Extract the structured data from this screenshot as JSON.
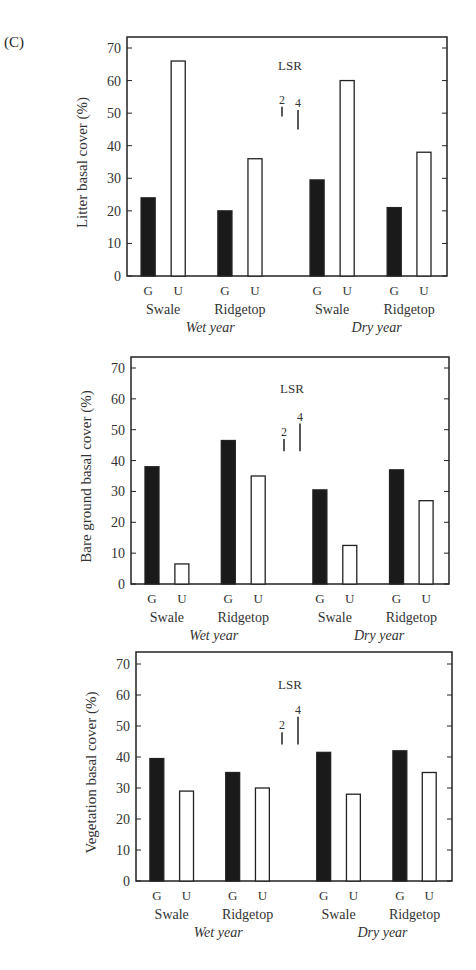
{
  "panel_label": "(C)",
  "chart_data": [
    {
      "type": "bar",
      "title": "",
      "ylabel": "Litter basal cover (%)",
      "xlabel": "",
      "ylim": [
        0,
        70
      ],
      "yticks": [
        0,
        10,
        20,
        30,
        40,
        50,
        60,
        70
      ],
      "grid": false,
      "legend_position": "none",
      "groups": [
        {
          "year": "Wet year",
          "site": "Swale"
        },
        {
          "year": "Wet year",
          "site": "Ridgetop"
        },
        {
          "year": "Dry year",
          "site": "Swale"
        },
        {
          "year": "Dry year",
          "site": "Ridgetop"
        }
      ],
      "categories": [
        "Wet Swale",
        "Wet Ridgetop",
        "Dry Swale",
        "Dry Ridgetop"
      ],
      "series": [
        {
          "name": "G",
          "fill": "#1a1a1a",
          "values": [
            24,
            20,
            29.5,
            21
          ]
        },
        {
          "name": "U",
          "fill": "#ffffff",
          "values": [
            66,
            36,
            60,
            38
          ]
        }
      ],
      "annotation": {
        "label": "LSR",
        "bars": [
          {
            "label": "2",
            "length": 3
          },
          {
            "label": "4",
            "length": 6
          }
        ]
      }
    },
    {
      "type": "bar",
      "title": "",
      "ylabel": "Bare ground basal cover (%)",
      "xlabel": "",
      "ylim": [
        0,
        70
      ],
      "yticks": [
        0,
        10,
        20,
        30,
        40,
        50,
        60,
        70
      ],
      "grid": false,
      "legend_position": "none",
      "groups": [
        {
          "year": "Wet year",
          "site": "Swale"
        },
        {
          "year": "Wet year",
          "site": "Ridgetop"
        },
        {
          "year": "Dry year",
          "site": "Swale"
        },
        {
          "year": "Dry year",
          "site": "Ridgetop"
        }
      ],
      "categories": [
        "Wet Swale",
        "Wet Ridgetop",
        "Dry Swale",
        "Dry Ridgetop"
      ],
      "series": [
        {
          "name": "G",
          "fill": "#1a1a1a",
          "values": [
            38,
            46.5,
            30.5,
            37
          ]
        },
        {
          "name": "U",
          "fill": "#ffffff",
          "values": [
            6.5,
            35,
            12.5,
            27
          ]
        }
      ],
      "annotation": {
        "label": "LSR",
        "bars": [
          {
            "label": "2",
            "length": 4
          },
          {
            "label": "4",
            "length": 9
          }
        ]
      }
    },
    {
      "type": "bar",
      "title": "",
      "ylabel": "Vegetation basal cover (%)",
      "xlabel": "",
      "ylim": [
        0,
        70
      ],
      "yticks": [
        0,
        10,
        20,
        30,
        40,
        50,
        60,
        70
      ],
      "grid": false,
      "legend_position": "none",
      "groups": [
        {
          "year": "Wet year",
          "site": "Swale"
        },
        {
          "year": "Wet year",
          "site": "Ridgetop"
        },
        {
          "year": "Dry year",
          "site": "Swale"
        },
        {
          "year": "Dry year",
          "site": "Ridgetop"
        }
      ],
      "categories": [
        "Wet Swale",
        "Wet Ridgetop",
        "Dry Swale",
        "Dry Ridgetop"
      ],
      "series": [
        {
          "name": "G",
          "fill": "#1a1a1a",
          "values": [
            39.5,
            35,
            41.5,
            42
          ]
        },
        {
          "name": "U",
          "fill": "#ffffff",
          "values": [
            29,
            30,
            28,
            35
          ]
        }
      ],
      "annotation": {
        "label": "LSR",
        "bars": [
          {
            "label": "2",
            "length": 4
          },
          {
            "label": "4",
            "length": 9
          }
        ]
      }
    }
  ],
  "layout": [
    {
      "top": 37,
      "left": 127,
      "right": 447,
      "baseline": 276,
      "ymax_px": 48,
      "lsr_x": 282,
      "lsr_label_y": 70,
      "lsr2_bottom": 49,
      "lsr4_bottom": 45
    },
    {
      "top": 357,
      "left": 131,
      "right": 449,
      "baseline": 584,
      "ymax_px": 368,
      "lsr_x": 284,
      "lsr_label_y": 393,
      "lsr2_bottom": 43,
      "lsr4_bottom": 43
    },
    {
      "top": 652,
      "left": 136,
      "right": 452,
      "baseline": 881,
      "ymax_px": 664,
      "lsr_x": 282,
      "lsr_label_y": 689,
      "lsr2_bottom": 44,
      "lsr4_bottom": 44
    }
  ]
}
